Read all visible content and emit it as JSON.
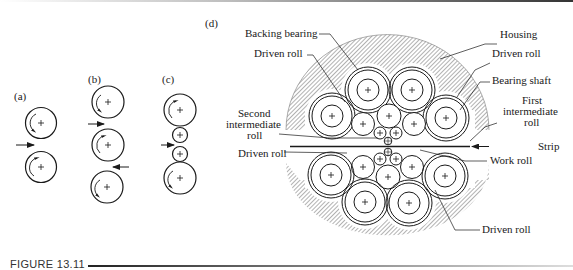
{
  "figure": {
    "number_label": "FIGURE 13.11",
    "panels": {
      "a": {
        "label": "(a)",
        "description": "Two-high mill"
      },
      "b": {
        "label": "(b)",
        "description": "Three-high mill"
      },
      "c": {
        "label": "(c)",
        "description": "Four-high mill"
      },
      "d": {
        "label": "(d)",
        "description": "Cluster (Sendzimir) mill"
      }
    },
    "callouts": {
      "backing_bearing": "Backing bearing",
      "driven_roll_upper_left": "Driven roll",
      "housing": "Housing",
      "driven_roll_upper_right": "Driven roll",
      "bearing_shaft": "Bearing shaft",
      "first_intermediate_roll": [
        "First",
        "intermediate",
        "roll"
      ],
      "second_intermediate_roll": [
        "Second",
        "intermediate",
        "roll"
      ],
      "driven_roll_lower_left": "Driven roll",
      "strip": "Strip",
      "work_roll": "Work roll",
      "driven_roll_lower_right": "Driven roll"
    },
    "colors": {
      "ink": "#1a1a1a",
      "hatch": "#555555",
      "background": "#ffffff"
    }
  }
}
